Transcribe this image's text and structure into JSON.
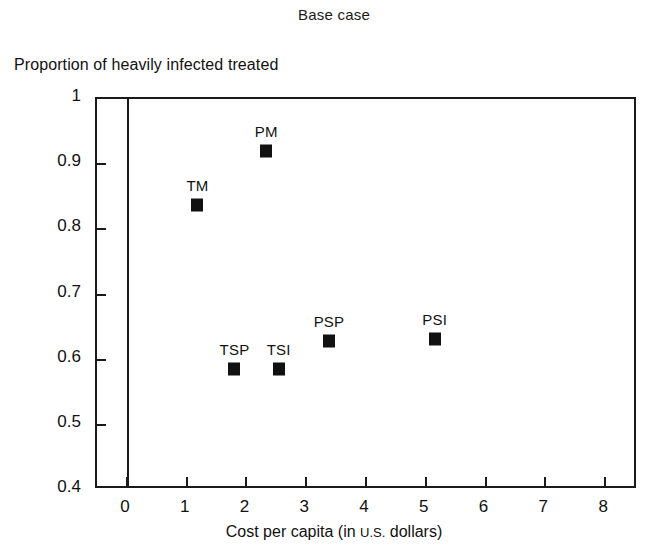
{
  "chart_data": {
    "type": "scatter",
    "title": "Base case",
    "xlabel": "Cost per capita (in U.S. dollars)",
    "xlabel_main_pre": "Cost per capita (in ",
    "xlabel_smallcaps": "U.S.",
    "xlabel_main_post": " dollars)",
    "ylabel": "Proportion of heavily infected treated",
    "xlim": [
      -0.5,
      8.55
    ],
    "ylim": [
      0.4,
      1.0
    ],
    "xticks": [
      0,
      1,
      2,
      3,
      4,
      5,
      6,
      7,
      8
    ],
    "xtick_labels": [
      "0",
      "1",
      "2",
      "3",
      "4",
      "5",
      "6",
      "7",
      "8"
    ],
    "yticks": [
      0.4,
      0.5,
      0.6,
      0.7,
      0.8,
      0.9,
      1.0
    ],
    "ytick_labels": [
      "0.4",
      "0.5",
      "0.6",
      "0.7",
      "0.8",
      "0.9",
      "1"
    ],
    "grid": false,
    "legend": "none",
    "zero_reference_line": 0,
    "marker_style": "filled-square",
    "points": [
      {
        "label": "TM",
        "x": 1.18,
        "y": 0.838,
        "label_pos": "above"
      },
      {
        "label": "PM",
        "x": 2.33,
        "y": 0.92,
        "label_pos": "above"
      },
      {
        "label": "TSP",
        "x": 1.8,
        "y": 0.586,
        "label_pos": "above"
      },
      {
        "label": "TSI",
        "x": 2.54,
        "y": 0.586,
        "label_pos": "above"
      },
      {
        "label": "PSP",
        "x": 3.38,
        "y": 0.628,
        "label_pos": "above"
      },
      {
        "label": "PSI",
        "x": 5.15,
        "y": 0.631,
        "label_pos": "above"
      }
    ]
  }
}
